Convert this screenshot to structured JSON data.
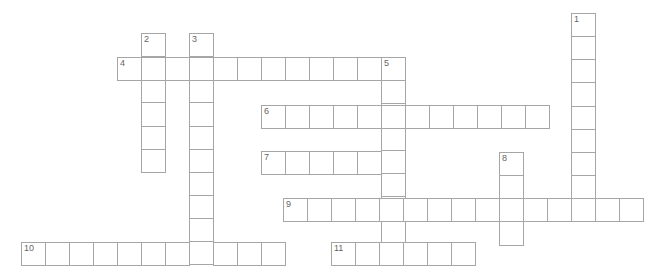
{
  "puzzle": {
    "cell_width": 24,
    "cell_height": 23.15,
    "border_color": "#a6a6a6",
    "number_color": "#666666",
    "entries": [
      {
        "number": "1",
        "direction": "down",
        "x": 571,
        "y": 13,
        "length": 9
      },
      {
        "number": "2",
        "direction": "down",
        "x": 141,
        "y": 33,
        "length": 6
      },
      {
        "number": "3",
        "direction": "down",
        "x": 189,
        "y": 33,
        "length": 10
      },
      {
        "number": "4",
        "direction": "across",
        "x": 117,
        "y": 57,
        "length": 12
      },
      {
        "number": "5",
        "direction": "down",
        "x": 381,
        "y": 57,
        "length": 9
      },
      {
        "number": "6",
        "direction": "across",
        "x": 261,
        "y": 105,
        "length": 12
      },
      {
        "number": "7",
        "direction": "across",
        "x": 261,
        "y": 151,
        "length": 6
      },
      {
        "number": "8",
        "direction": "down",
        "x": 499,
        "y": 152,
        "length": 4
      },
      {
        "number": "9",
        "direction": "across",
        "x": 283,
        "y": 198,
        "length": 15
      },
      {
        "number": "10",
        "direction": "across",
        "x": 21,
        "y": 242,
        "length": 11
      },
      {
        "number": "11",
        "direction": "across",
        "x": 331,
        "y": 242,
        "length": 6
      }
    ]
  }
}
